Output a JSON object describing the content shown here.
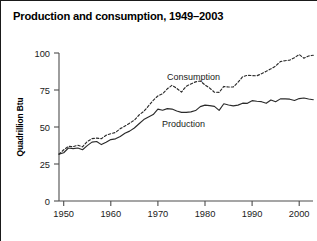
{
  "figure": {
    "title": "Production and consumption, 1949–2003"
  },
  "axes": {
    "y_title": "Quadrillion Btu",
    "y_ticks": [
      "0",
      "25",
      "50",
      "75",
      "100"
    ],
    "x_ticks": [
      "1950",
      "1960",
      "1970",
      "1980",
      "1990",
      "2000"
    ]
  },
  "annotations": {
    "consumption_label": "Consumption",
    "production_label": "Production"
  },
  "colors": {
    "line": "#2b2b2b",
    "axis": "#4d4d4d",
    "text": "#000000",
    "background": "#ffffff"
  },
  "chart_data": {
    "type": "line",
    "title": "Production and consumption, 1949–2003",
    "xlabel": "",
    "ylabel": "Quadrillion Btu",
    "xlim": [
      1949,
      2003
    ],
    "ylim": [
      0,
      100
    ],
    "xticks": [
      1950,
      1960,
      1970,
      1980,
      1990,
      2000
    ],
    "yticks": [
      0,
      25,
      50,
      75,
      100
    ],
    "grid": false,
    "legend": "inline-annotations",
    "x": [
      1949,
      1950,
      1951,
      1952,
      1953,
      1954,
      1955,
      1956,
      1957,
      1958,
      1959,
      1960,
      1961,
      1962,
      1963,
      1964,
      1965,
      1966,
      1967,
      1968,
      1969,
      1970,
      1971,
      1972,
      1973,
      1974,
      1975,
      1976,
      1977,
      1978,
      1979,
      1980,
      1981,
      1982,
      1983,
      1984,
      1985,
      1986,
      1987,
      1988,
      1989,
      1990,
      1991,
      1992,
      1993,
      1994,
      1995,
      1996,
      1997,
      1998,
      1999,
      2000,
      2001,
      2002,
      2003
    ],
    "series": [
      {
        "name": "Production",
        "style": "solid",
        "values": [
          31.7,
          32.6,
          35.8,
          35.4,
          35.8,
          34.6,
          37.4,
          39.8,
          40.2,
          38.1,
          39.7,
          41.5,
          42.0,
          43.6,
          45.8,
          47.2,
          49.3,
          52.2,
          55.0,
          56.8,
          58.4,
          62.1,
          61.3,
          62.4,
          62.1,
          60.8,
          59.9,
          59.9,
          60.2,
          61.1,
          63.8,
          64.8,
          64.4,
          63.9,
          61.2,
          65.7,
          64.9,
          64.3,
          64.8,
          66.1,
          66.0,
          67.8,
          67.4,
          67.1,
          66.0,
          68.3,
          67.1,
          69.0,
          69.0,
          68.8,
          67.9,
          69.2,
          69.6,
          68.9,
          68.4
        ]
      },
      {
        "name": "Consumption",
        "style": "dashed",
        "values": [
          31.6,
          34.6,
          36.9,
          36.7,
          37.7,
          36.6,
          40.2,
          42.1,
          42.5,
          42.1,
          44.4,
          45.5,
          46.3,
          48.9,
          50.6,
          52.6,
          54.6,
          58.1,
          60.6,
          64.2,
          68.0,
          71.0,
          72.5,
          75.8,
          78.2,
          76.1,
          73.6,
          77.5,
          79.1,
          80.5,
          81.1,
          78.4,
          76.3,
          73.5,
          73.4,
          77.4,
          77.0,
          77.0,
          80.2,
          84.0,
          85.0,
          84.7,
          84.6,
          86.0,
          87.6,
          89.3,
          91.2,
          94.2,
          94.8,
          95.2,
          96.8,
          99.0,
          96.5,
          98.0,
          98.5
        ]
      }
    ]
  }
}
